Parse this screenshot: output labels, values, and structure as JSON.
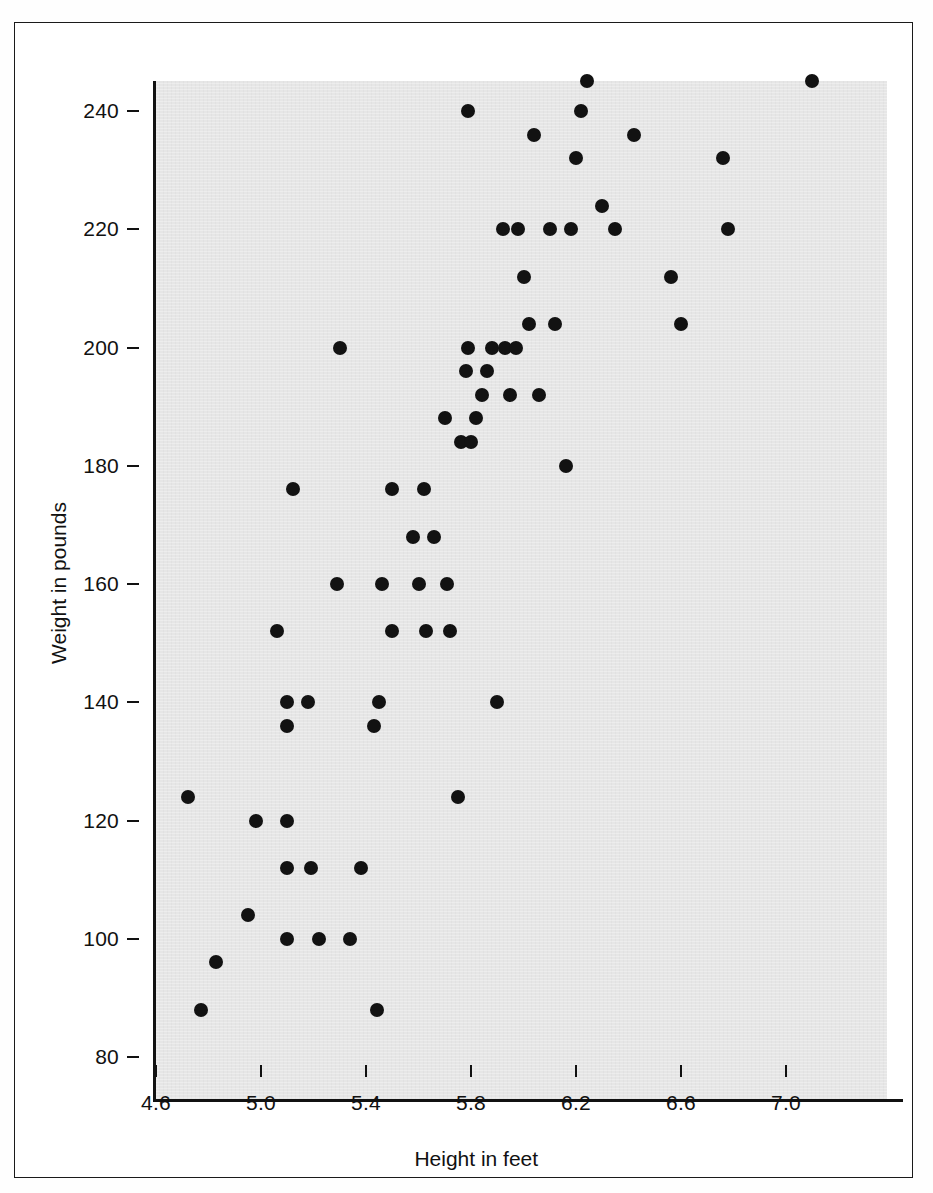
{
  "figure": {
    "background_color": "#ffffff",
    "plot_field_color": "#e6e6e6",
    "axis_color": "#111111",
    "marker_color": "#121212"
  },
  "chart_data": {
    "type": "scatter",
    "title": "",
    "xlabel": "Height in feet",
    "ylabel": "Weight in pounds",
    "xlim": [
      4.54,
      7.31
    ],
    "ylim": [
      78,
      249
    ],
    "xticks": [
      4.6,
      5.0,
      5.4,
      5.8,
      6.2,
      6.6,
      7.0
    ],
    "xticklabels": [
      "4.6",
      "5.0",
      "5.4",
      "5.8",
      "6.2",
      "6.6",
      "7.0"
    ],
    "yticks": [
      80,
      100,
      120,
      140,
      160,
      180,
      200,
      220,
      240
    ],
    "yticklabels": [
      "80",
      "100",
      "120",
      "140",
      "160",
      "180",
      "200",
      "220",
      "240"
    ],
    "grid": false,
    "legend": null,
    "marker": "filled-circle",
    "marker_size_px": 14,
    "series": [
      {
        "name": "Height vs Weight",
        "x": [
          4.72,
          4.77,
          4.83,
          4.95,
          4.98,
          5.06,
          5.1,
          5.1,
          5.1,
          5.1,
          5.1,
          5.12,
          5.18,
          5.19,
          5.22,
          5.29,
          5.3,
          5.34,
          5.38,
          5.43,
          5.44,
          5.45,
          5.46,
          5.5,
          5.5,
          5.58,
          5.6,
          5.62,
          5.63,
          5.66,
          5.7,
          5.71,
          5.72,
          5.75,
          5.76,
          5.78,
          5.79,
          5.79,
          5.8,
          5.82,
          5.84,
          5.86,
          5.88,
          5.9,
          5.92,
          5.93,
          5.95,
          5.97,
          5.98,
          6.0,
          6.02,
          6.04,
          6.06,
          6.1,
          6.12,
          6.16,
          6.18,
          6.2,
          6.22,
          6.24,
          6.3,
          6.35,
          6.42,
          6.56,
          6.6,
          6.76,
          6.78,
          7.1
        ],
        "y": [
          124,
          88,
          96,
          104,
          120,
          152,
          140,
          136,
          120,
          112,
          100,
          176,
          140,
          112,
          100,
          160,
          200,
          100,
          112,
          136,
          88,
          140,
          160,
          152,
          176,
          168,
          160,
          176,
          152,
          168,
          188,
          160,
          152,
          124,
          184,
          196,
          200,
          240,
          184,
          188,
          192,
          196,
          200,
          140,
          220,
          200,
          192,
          200,
          220,
          212,
          204,
          236,
          192,
          220,
          204,
          180,
          220,
          232,
          240,
          245,
          224,
          220,
          236,
          212,
          204,
          232,
          220,
          245
        ]
      }
    ]
  },
  "axes": {
    "y_tick_positions_px": [
      1056,
      940,
      820,
      700,
      583,
      466,
      346,
      228,
      110
    ],
    "x_tick_positions_px": [
      155,
      261,
      367,
      472,
      575,
      680,
      785
    ]
  }
}
